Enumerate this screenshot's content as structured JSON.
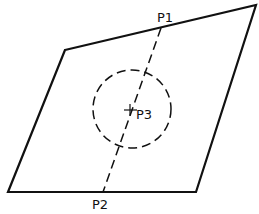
{
  "diagram": {
    "labels": {
      "p1": "P1",
      "p2": "P2",
      "p3": "P3"
    },
    "colors": {
      "stroke": "#111111",
      "background": "#ffffff"
    }
  }
}
